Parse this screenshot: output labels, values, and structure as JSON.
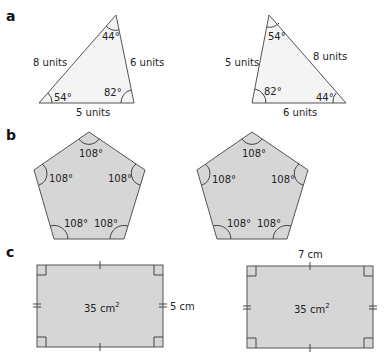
{
  "parts": {
    "a": {
      "label": "a",
      "triangle_left": {
        "angles": [
          "44°",
          "54°",
          "82°"
        ],
        "sides": [
          "8 units",
          "6 units",
          "5 units"
        ]
      },
      "triangle_right": {
        "angles": [
          "54°",
          "82°",
          "44°"
        ],
        "sides": [
          "5 units",
          "8 units",
          "6 units"
        ]
      }
    },
    "b": {
      "label": "b",
      "pentagon_left": {
        "angles": [
          "108°",
          "108°",
          "108°",
          "108°",
          "108°"
        ]
      },
      "pentagon_right": {
        "angles": [
          "108°",
          "108°",
          "108°",
          "108°",
          "108°"
        ]
      }
    },
    "c": {
      "label": "c",
      "rectangle_left": {
        "area_value": "35 cm",
        "area_exp": "2",
        "side": "5 cm"
      },
      "rectangle_right": {
        "area_value": "35 cm",
        "area_exp": "2",
        "side": "7 cm"
      }
    }
  },
  "colors": {
    "triangle_fill": "#f4f4f4",
    "shape_fill": "#d6d6d6",
    "stroke": "#555555"
  }
}
